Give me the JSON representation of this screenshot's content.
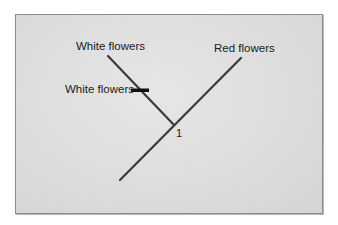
{
  "diagram": {
    "type": "cladogram",
    "taxa": [
      {
        "label": "White flowers",
        "position": "left-tip"
      },
      {
        "label": "Red flowers",
        "position": "right-tip"
      }
    ],
    "character_mark": {
      "label": "White flowers",
      "on_branch": "left"
    },
    "node_label": "1",
    "colors": {
      "background": "#dcdcdc",
      "branch": "#3a3a3a",
      "mark": "#111111",
      "border": "#8c8c8c"
    }
  }
}
